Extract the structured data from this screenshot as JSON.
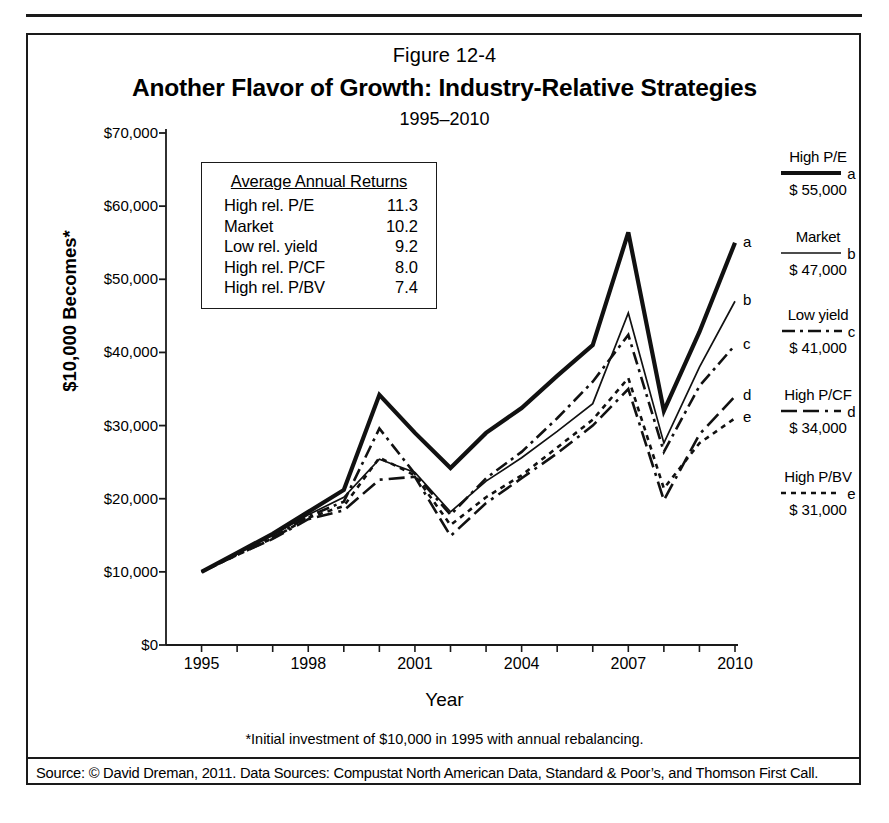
{
  "figure": {
    "number": "Figure 12-4",
    "title": "Another Flavor of Growth: Industry-Relative Strategies",
    "subtitle": "1995–2010"
  },
  "footnote": "*Initial investment of $10,000 in 1995 with annual rebalancing.",
  "source": "Source: © David Dreman, 2011. Data Sources: Compustat North American Data, Standard & Poor’s, and Thomson First Call.",
  "returns_box": {
    "heading": "Average Annual Returns",
    "rows": [
      {
        "name": "High rel. P/E",
        "value": "11.3"
      },
      {
        "name": "Market",
        "value": "10.2"
      },
      {
        "name": "Low rel. yield",
        "value": "9.2"
      },
      {
        "name": "High rel. P/CF",
        "value": "8.0"
      },
      {
        "name": "High rel. P/BV",
        "value": "7.4"
      }
    ]
  },
  "legend": [
    {
      "name": "High P/E",
      "key": "a",
      "final": "$ 55,000",
      "style": "solid-thick"
    },
    {
      "name": "Market",
      "key": "b",
      "final": "$ 47,000",
      "style": "solid-thin"
    },
    {
      "name": "Low yield",
      "key": "c",
      "final": "$ 41,000",
      "style": "dash-dot"
    },
    {
      "name": "High P/CF",
      "key": "d",
      "final": "$ 34,000",
      "style": "long-dash-dot"
    },
    {
      "name": "High P/BV",
      "key": "e",
      "final": "$ 31,000",
      "style": "dotted"
    }
  ],
  "endpoint_labels": [
    "a",
    "b",
    "c",
    "d",
    "e"
  ],
  "chart_data": {
    "type": "line",
    "title": "Another Flavor of Growth: Industry-Relative Strategies",
    "subtitle": "1995–2010",
    "xlabel": "Year",
    "ylabel": "$10,000 Becomes*",
    "xlim": [
      1994,
      2010
    ],
    "ylim": [
      0,
      70000
    ],
    "grid": false,
    "legend_position": "right",
    "yticks": [
      0,
      10000,
      20000,
      30000,
      40000,
      50000,
      60000,
      70000
    ],
    "ytick_labels": [
      "$0",
      "$10,000",
      "$20,000",
      "$30,000",
      "$40,000",
      "$50,000",
      "$60,000",
      "$70,000"
    ],
    "xticks": [
      1995,
      1996,
      1997,
      1998,
      1999,
      2000,
      2001,
      2002,
      2003,
      2004,
      2005,
      2006,
      2007,
      2008,
      2009,
      2010
    ],
    "xtick_labels_shown": [
      "1995",
      "1998",
      "2001",
      "2004",
      "2007",
      "2010"
    ],
    "x": [
      1995,
      1996,
      1997,
      1998,
      1999,
      2000,
      2001,
      2002,
      2003,
      2004,
      2005,
      2006,
      2007,
      2008,
      2009,
      2010
    ],
    "series": [
      {
        "name": "High rel. P/E",
        "key": "a",
        "style": "solid-thick",
        "values": [
          10000,
          12600,
          15200,
          18200,
          21200,
          34200,
          29000,
          24200,
          29000,
          32400,
          36800,
          41000,
          56400,
          32000,
          42800,
          55000
        ]
      },
      {
        "name": "Market",
        "key": "b",
        "style": "solid-thin",
        "values": [
          10000,
          12500,
          15000,
          17800,
          20200,
          25400,
          23600,
          18200,
          22400,
          25600,
          29200,
          33000,
          45400,
          27600,
          38000,
          47000
        ]
      },
      {
        "name": "Low rel. yield",
        "key": "c",
        "style": "dash-dot",
        "values": [
          10000,
          12400,
          14700,
          17600,
          19600,
          29600,
          23400,
          17800,
          22800,
          26400,
          31000,
          36000,
          42400,
          26400,
          35400,
          41000
        ]
      },
      {
        "name": "High rel. P/CF",
        "key": "d",
        "style": "long-dash-dot",
        "values": [
          10000,
          12300,
          14500,
          17200,
          18400,
          22600,
          23000,
          14900,
          19400,
          22800,
          26200,
          30000,
          35000,
          19800,
          28800,
          34000
        ]
      },
      {
        "name": "High rel. P/BV",
        "key": "e",
        "style": "dotted",
        "values": [
          10000,
          12300,
          14600,
          17400,
          19000,
          25600,
          23200,
          16400,
          20200,
          23200,
          27000,
          30800,
          36500,
          21400,
          27600,
          31000
        ]
      }
    ]
  }
}
